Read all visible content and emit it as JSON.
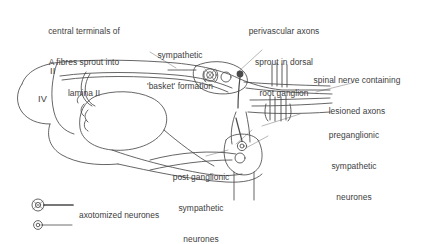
{
  "figure": {
    "kind": "anatomical-schematic",
    "background_color": "#ffffff",
    "ink_color": "#4a4a4a",
    "text_color": "#3d3d3d"
  },
  "labels": {
    "central_terminals": {
      "lines": [
        "central terminals of",
        "A fibres sprout into",
        "lamina II"
      ],
      "align": "center"
    },
    "sympathetic_basket": {
      "lines": [
        "sympathetic",
        "'basket' formation"
      ],
      "align": "center"
    },
    "perivascular_axons": {
      "lines": [
        "perivascular axons",
        "sprout in dorsal",
        "root ganglion"
      ],
      "align": "center"
    },
    "spinal_nerve": {
      "lines": [
        "spinal nerve containing",
        "lesioned axons"
      ],
      "align": "center"
    },
    "preganglionic": {
      "lines": [
        "preganglionic",
        "sympathetic",
        "neurones"
      ],
      "align": "center"
    },
    "post_ganglionic": {
      "lines": [
        "post ganglionic",
        "sympathetic",
        "neurones"
      ],
      "align": "center"
    }
  },
  "laminae": [
    {
      "name": "lamina-II",
      "text": "II"
    },
    {
      "name": "lamina-IV",
      "text": "IV"
    }
  ],
  "legend": {
    "caption": "axotomized neurones",
    "symbols": [
      {
        "name": "axotomized-neurone-large",
        "style": "large-stippled-soma-thick-axon"
      },
      {
        "name": "axotomized-neurone-small",
        "style": "small-stippled-soma-thin-axon"
      }
    ]
  },
  "structures": [
    {
      "name": "dorsal-horn-outline"
    },
    {
      "name": "gray-matter-butterfly"
    },
    {
      "name": "ventral-horn-outline"
    },
    {
      "name": "dorsal-root-ganglion"
    },
    {
      "name": "drg-neuron-soma",
      "count": 3
    },
    {
      "name": "sympathetic-chain-ganglion"
    },
    {
      "name": "sympathetic-ganglion-soma",
      "count": 2
    },
    {
      "name": "lesion-hatch-marks",
      "count": 8
    },
    {
      "name": "spinal-nerve-trunk"
    },
    {
      "name": "sprouting-afferent-fibres"
    }
  ]
}
